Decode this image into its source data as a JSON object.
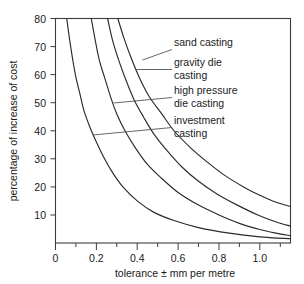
{
  "chart_data": {
    "type": "line",
    "title": "",
    "xlabel": "tolerance ± mm per metre",
    "ylabel": "percentage of increase of cost",
    "xlim": [
      0,
      1.15
    ],
    "ylim": [
      0,
      80
    ],
    "grid": false,
    "legend_position": "inline-right-annotations",
    "x_ticks": [
      {
        "value": 0,
        "label": "0",
        "major": true
      },
      {
        "value": 0.1,
        "label": "",
        "major": false
      },
      {
        "value": 0.2,
        "label": "0.2",
        "major": true
      },
      {
        "value": 0.3,
        "label": "",
        "major": false
      },
      {
        "value": 0.4,
        "label": "0.4",
        "major": true
      },
      {
        "value": 0.5,
        "label": "",
        "major": false
      },
      {
        "value": 0.6,
        "label": "0.6",
        "major": true
      },
      {
        "value": 0.7,
        "label": "",
        "major": false
      },
      {
        "value": 0.8,
        "label": "0.8",
        "major": true
      },
      {
        "value": 0.9,
        "label": "",
        "major": false
      },
      {
        "value": 1.0,
        "label": "1.0",
        "major": true
      },
      {
        "value": 1.1,
        "label": "",
        "major": false
      }
    ],
    "y_ticks": [
      {
        "value": 10,
        "label": "10"
      },
      {
        "value": 20,
        "label": "20"
      },
      {
        "value": 30,
        "label": "30"
      },
      {
        "value": 40,
        "label": "40"
      },
      {
        "value": 50,
        "label": "50"
      },
      {
        "value": 60,
        "label": "60"
      },
      {
        "value": 70,
        "label": "70"
      },
      {
        "value": 80,
        "label": "80"
      }
    ],
    "series": [
      {
        "name": "investment casting",
        "label": "investment casting",
        "label_lines": [
          "investment",
          "casting"
        ],
        "color": "#2b2b2b",
        "points": [
          [
            0.055,
            80
          ],
          [
            0.07,
            72
          ],
          [
            0.085,
            65
          ],
          [
            0.1,
            59
          ],
          [
            0.12,
            53
          ],
          [
            0.14,
            47
          ],
          [
            0.17,
            41
          ],
          [
            0.2,
            36
          ],
          [
            0.24,
            30
          ],
          [
            0.28,
            25
          ],
          [
            0.33,
            20
          ],
          [
            0.4,
            15
          ],
          [
            0.48,
            11
          ],
          [
            0.58,
            8
          ],
          [
            0.7,
            5.5
          ],
          [
            0.85,
            3.5
          ],
          [
            1.0,
            2.2
          ],
          [
            1.15,
            1.5
          ]
        ],
        "leader_anchor": [
          0.185,
          38.5
        ]
      },
      {
        "name": "high pressure die casting",
        "label": "high pressure die casting",
        "label_lines": [
          "high pressure",
          "die casting"
        ],
        "color": "#2b2b2b",
        "points": [
          [
            0.175,
            80
          ],
          [
            0.195,
            72
          ],
          [
            0.215,
            65
          ],
          [
            0.24,
            59
          ],
          [
            0.27,
            52
          ],
          [
            0.3,
            46
          ],
          [
            0.34,
            40
          ],
          [
            0.39,
            34
          ],
          [
            0.45,
            28
          ],
          [
            0.52,
            23
          ],
          [
            0.6,
            18
          ],
          [
            0.7,
            13.5
          ],
          [
            0.8,
            10
          ],
          [
            0.9,
            7
          ],
          [
            1.0,
            4.8
          ],
          [
            1.08,
            3.5
          ],
          [
            1.15,
            2.6
          ]
        ],
        "leader_anchor": [
          0.285,
          50
        ]
      },
      {
        "name": "gravity die casting",
        "label": "gravity die casting",
        "label_lines": [
          "gravity die",
          "casting"
        ],
        "color": "#2b2b2b",
        "points": [
          [
            0.255,
            80
          ],
          [
            0.28,
            72
          ],
          [
            0.31,
            65
          ],
          [
            0.345,
            58
          ],
          [
            0.385,
            51
          ],
          [
            0.43,
            45
          ],
          [
            0.48,
            39
          ],
          [
            0.545,
            33
          ],
          [
            0.62,
            27
          ],
          [
            0.7,
            22
          ],
          [
            0.79,
            17.5
          ],
          [
            0.89,
            13.5
          ],
          [
            0.99,
            10
          ],
          [
            1.08,
            7.5
          ],
          [
            1.15,
            6
          ]
        ],
        "leader_anchor": [
          0.395,
          62
        ]
      },
      {
        "name": "sand casting",
        "label": "sand casting",
        "label_lines": [
          "sand casting"
        ],
        "color": "#2b2b2b",
        "points": [
          [
            0.305,
            80
          ],
          [
            0.335,
            73
          ],
          [
            0.37,
            66
          ],
          [
            0.41,
            59
          ],
          [
            0.46,
            52
          ],
          [
            0.52,
            46
          ],
          [
            0.58,
            40
          ],
          [
            0.66,
            34
          ],
          [
            0.74,
            29
          ],
          [
            0.83,
            24
          ],
          [
            0.92,
            20
          ],
          [
            1.0,
            17
          ],
          [
            1.08,
            14.5
          ],
          [
            1.15,
            13
          ]
        ],
        "leader_anchor": [
          0.425,
          69
        ]
      }
    ],
    "annotations": [
      {
        "text": "sand casting",
        "series": "sand casting"
      },
      {
        "text": "gravity die casting",
        "series": "gravity die casting"
      },
      {
        "text": "high pressure die casting",
        "series": "high pressure die casting"
      },
      {
        "text": "investment casting",
        "series": "investment casting"
      }
    ]
  },
  "labels": {
    "y_axis_title": "percentage of increase of cost",
    "x_axis_title": "tolerance ± mm per metre",
    "sand_casting": "sand casting",
    "gravity_die_1": "gravity die",
    "gravity_die_2": "casting",
    "high_pressure_1": "high pressure",
    "high_pressure_2": "die casting",
    "investment_1": "investment",
    "investment_2": "casting",
    "y_80": "80",
    "y_70": "70",
    "y_60": "60",
    "y_50": "50",
    "y_40": "40",
    "y_30": "30",
    "y_20": "20",
    "y_10": "10",
    "x_0": "0",
    "x_02": "0.2",
    "x_04": "0.4",
    "x_06": "0.6",
    "x_08": "0.8",
    "x_10": "1.0"
  },
  "colors": {
    "curve": "#2b2b2b",
    "axis": "#3c3c3c",
    "text": "#1a1a1a",
    "background": "#ffffff"
  }
}
